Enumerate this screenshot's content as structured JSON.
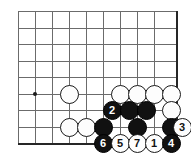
{
  "board": {
    "title": "Go board joseki diagram",
    "geometry": {
      "origin_x": 18,
      "origin_y": 11,
      "spacing_x": 17,
      "spacing_y": 16.5,
      "cols": 10,
      "rows": 9,
      "right_edge_x": 176,
      "bottom_edge_y": 143
    },
    "colors": {
      "grid": "#6b6b6b",
      "edge": "#262626",
      "black_stone": "#111111",
      "white_stone": "#fdfdfd",
      "background": "#ffffff"
    },
    "star_points": [
      {
        "name": "hoshi-left",
        "x": 35,
        "y": 94
      }
    ],
    "stones": [
      {
        "name": "white-stone-a",
        "color": "white",
        "x": 69,
        "y": 94,
        "label": ""
      },
      {
        "name": "white-stone-b",
        "color": "white",
        "x": 120,
        "y": 94,
        "label": ""
      },
      {
        "name": "white-stone-c",
        "color": "white",
        "x": 137,
        "y": 94,
        "label": ""
      },
      {
        "name": "white-stone-d",
        "color": "white",
        "x": 154,
        "y": 94,
        "label": ""
      },
      {
        "name": "white-stone-e",
        "color": "white",
        "x": 171,
        "y": 94,
        "label": ""
      },
      {
        "name": "black-move-2",
        "color": "black",
        "x": 112,
        "y": 110,
        "label": "2"
      },
      {
        "name": "black-stone-f",
        "color": "black",
        "x": 129,
        "y": 110,
        "label": ""
      },
      {
        "name": "black-stone-g",
        "color": "black",
        "x": 146,
        "y": 110,
        "label": ""
      },
      {
        "name": "white-stone-h",
        "color": "white",
        "x": 171,
        "y": 110,
        "label": ""
      },
      {
        "name": "white-stone-i",
        "color": "white",
        "x": 69,
        "y": 127,
        "label": ""
      },
      {
        "name": "white-stone-j",
        "color": "white",
        "x": 86,
        "y": 127,
        "label": ""
      },
      {
        "name": "black-stone-k",
        "color": "black",
        "x": 103,
        "y": 127,
        "label": ""
      },
      {
        "name": "black-stone-l",
        "color": "black",
        "x": 137,
        "y": 127,
        "label": ""
      },
      {
        "name": "black-stone-m",
        "color": "black",
        "x": 171,
        "y": 127,
        "label": ""
      },
      {
        "name": "white-move-3",
        "color": "white",
        "x": 182,
        "y": 127,
        "label": "3"
      },
      {
        "name": "black-move-6",
        "color": "black",
        "x": 103,
        "y": 143,
        "label": "6"
      },
      {
        "name": "white-move-5",
        "color": "white",
        "x": 120,
        "y": 143,
        "label": "5"
      },
      {
        "name": "white-move-7",
        "color": "white",
        "x": 137,
        "y": 143,
        "label": "7"
      },
      {
        "name": "white-move-1",
        "color": "white",
        "x": 154,
        "y": 143,
        "label": "1"
      },
      {
        "name": "black-move-4",
        "color": "black",
        "x": 171,
        "y": 143,
        "label": "4"
      }
    ]
  }
}
